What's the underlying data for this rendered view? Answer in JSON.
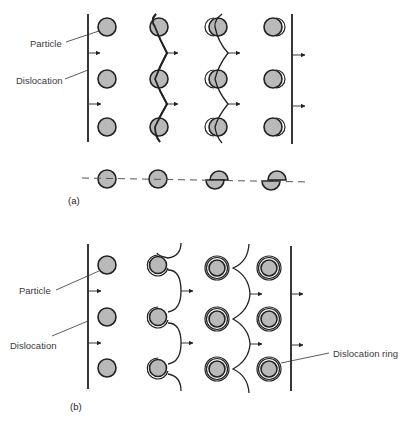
{
  "panel_a": {
    "label": "(a)",
    "title_particle": "Particle",
    "title_dislocation": "Dislocation",
    "description": "Dislocation cutting (shearing) through particles",
    "stages": [
      "straight dislocation approaching",
      "dislocation bends and cuts particles",
      "particles partially sheared",
      "dislocation passed, particles sheared"
    ]
  },
  "panel_b": {
    "label": "(b)",
    "title_particle": "Particle",
    "title_dislocation": "Dislocation",
    "title_ring": "Dislocation ring",
    "description": "Dislocation bowing (Orowan looping) around particles",
    "stages": [
      "straight dislocation approaching",
      "dislocation bows between particles",
      "loops pinch off",
      "dislocation passed, rings left around particles"
    ]
  },
  "colors": {
    "particle_fill": "#b9b9b9",
    "line": "#222222",
    "background": "#ffffff"
  }
}
